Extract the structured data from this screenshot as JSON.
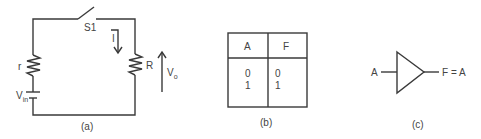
{
  "figure": {
    "panels": [
      {
        "id": "a",
        "caption": "(a)",
        "type": "circuit",
        "components": {
          "switch": {
            "label": "S1"
          },
          "internal_resistor": {
            "label": "r"
          },
          "load_resistor": {
            "label": "R"
          },
          "source": {
            "label": "V",
            "subscript": "in"
          },
          "current": {
            "label": "I"
          },
          "output_voltage": {
            "label": "V",
            "subscript": "o"
          }
        }
      },
      {
        "id": "b",
        "caption": "(b)",
        "type": "truth_table",
        "headers": [
          "A",
          "F"
        ],
        "rows": [
          [
            "0",
            "0"
          ],
          [
            "1",
            "1"
          ]
        ]
      },
      {
        "id": "c",
        "caption": "(c)",
        "type": "buffer_gate",
        "input_label": "A",
        "output_label": "F = A"
      }
    ]
  },
  "colors": {
    "line": "#3a3a3a",
    "text": "#444444",
    "background": "#ffffff"
  }
}
